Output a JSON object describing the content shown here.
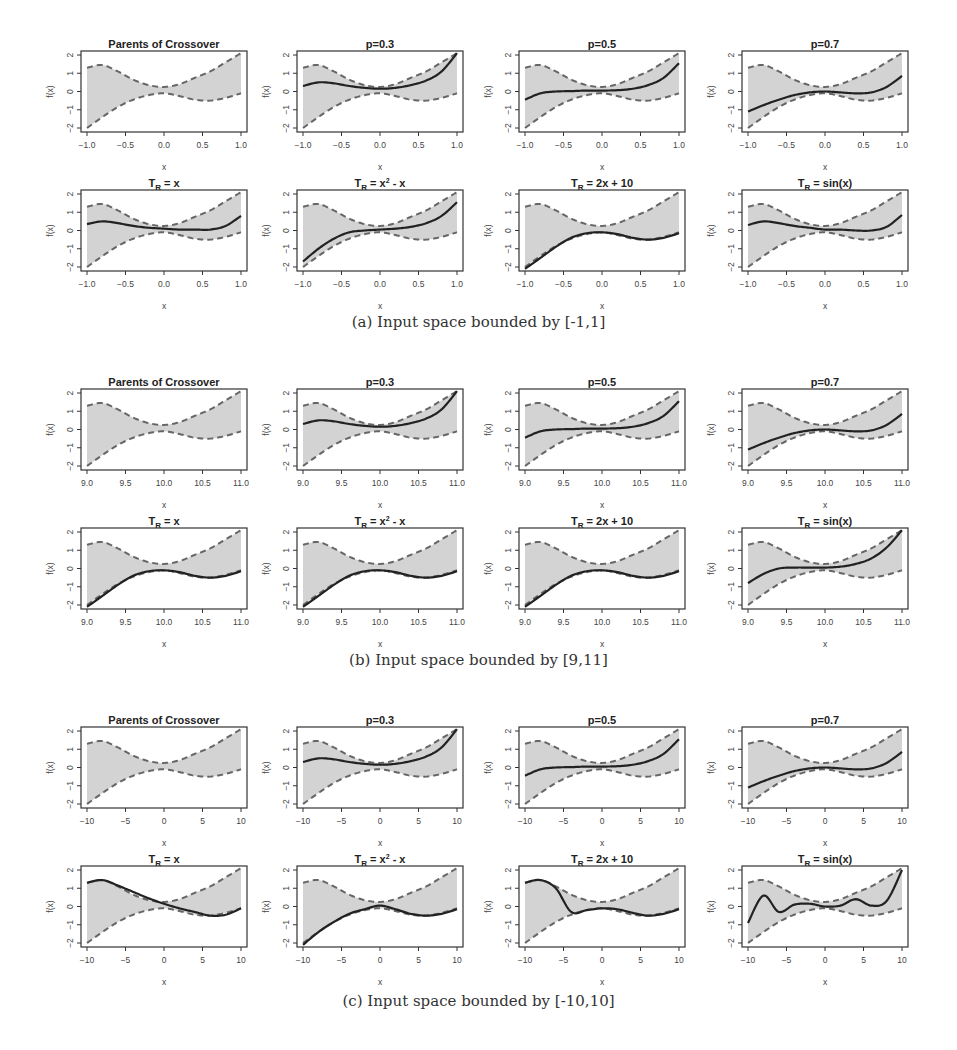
{
  "figure": {
    "subfigures": [
      {
        "id": "a",
        "caption": "(a) Input space bounded by [-1,1]",
        "xticks": [
          "-1.0",
          "-0.5",
          "0.0",
          "0.5",
          "1.0"
        ],
        "xrange": [
          -1,
          1
        ]
      },
      {
        "id": "b",
        "caption": "(b) Input space bounded by [9,11]",
        "xticks": [
          "9.0",
          "9.5",
          "10.0",
          "10.5",
          "11.0"
        ],
        "xrange": [
          9,
          11
        ]
      },
      {
        "id": "c",
        "caption": "(c) Input space bounded by [-10,10]",
        "xticks": [
          "-10",
          "-5",
          "0",
          "5",
          "10"
        ],
        "xrange": [
          -10,
          10
        ]
      }
    ],
    "plot_titles": [
      "Parents of Crossover",
      "p=0.3",
      "p=0.5",
      "p=0.7",
      "T_R = x",
      "T_R = x^2 - x",
      "T_R = 2x + 10",
      "T_R = sin(x)"
    ],
    "yticks": [
      "-2",
      "-1",
      "0",
      "1",
      "2"
    ],
    "xlabel": "x",
    "ylabel": "f(x)",
    "colors": {
      "band": "#d3d3d3",
      "dashed": "#666666",
      "curve": "#222222",
      "frame": "#333333"
    }
  },
  "chart_data": {
    "type": "line",
    "xlabel": "x (normalized position t in [0,1] across the input range)",
    "ylabel": "f(x)",
    "ylim": [
      -2,
      2
    ],
    "grid": false,
    "legend": "none",
    "t": [
      0,
      0.1,
      0.2,
      0.3,
      0.4,
      0.5,
      0.6,
      0.7,
      0.8,
      0.9,
      1.0
    ],
    "parent_upper": [
      1.3,
      1.45,
      1.1,
      0.65,
      0.35,
      0.25,
      0.4,
      0.75,
      1.1,
      1.6,
      2.1
    ],
    "parent_lower": [
      -2.0,
      -1.4,
      -0.85,
      -0.45,
      -0.2,
      -0.1,
      -0.25,
      -0.45,
      -0.5,
      -0.35,
      -0.1
    ],
    "panels": {
      "a": {
        "p=0.3": [
          0.3,
          0.5,
          0.45,
          0.3,
          0.2,
          0.15,
          0.2,
          0.35,
          0.6,
          1.1,
          2.1
        ],
        "p=0.5": [
          -0.45,
          -0.1,
          0.0,
          0.02,
          0.05,
          0.05,
          0.07,
          0.15,
          0.35,
          0.75,
          1.55
        ],
        "p=0.7": [
          -1.1,
          -0.75,
          -0.45,
          -0.2,
          -0.05,
          0.0,
          -0.05,
          -0.1,
          -0.05,
          0.25,
          0.85
        ],
        "T_R=x": [
          0.35,
          0.5,
          0.4,
          0.25,
          0.15,
          0.1,
          0.05,
          0.05,
          0.05,
          0.25,
          0.8
        ],
        "T_R=x^2-x": [
          -1.7,
          -1.0,
          -0.45,
          -0.1,
          0.0,
          0.05,
          0.1,
          0.2,
          0.4,
          0.8,
          1.55
        ],
        "T_R=2x+10": [
          -2.1,
          -1.5,
          -0.9,
          -0.4,
          -0.15,
          -0.1,
          -0.2,
          -0.4,
          -0.5,
          -0.4,
          -0.15
        ],
        "T_R=sin(x)": [
          0.3,
          0.5,
          0.4,
          0.25,
          0.15,
          0.05,
          0.05,
          0.0,
          0.0,
          0.2,
          0.85
        ]
      },
      "b": {
        "p=0.3": [
          0.3,
          0.5,
          0.45,
          0.3,
          0.2,
          0.15,
          0.2,
          0.35,
          0.6,
          1.1,
          2.1
        ],
        "p=0.5": [
          -0.45,
          -0.1,
          0.0,
          0.02,
          0.05,
          0.05,
          0.07,
          0.15,
          0.35,
          0.75,
          1.55
        ],
        "p=0.7": [
          -1.1,
          -0.75,
          -0.45,
          -0.2,
          -0.05,
          0.0,
          -0.05,
          -0.1,
          -0.05,
          0.25,
          0.85
        ],
        "T_R=x": [
          -2.1,
          -1.5,
          -0.9,
          -0.4,
          -0.15,
          -0.1,
          -0.2,
          -0.4,
          -0.5,
          -0.4,
          -0.15
        ],
        "T_R=x^2-x": [
          -2.1,
          -1.5,
          -0.9,
          -0.4,
          -0.15,
          -0.1,
          -0.2,
          -0.4,
          -0.5,
          -0.4,
          -0.15
        ],
        "T_R=2x+10": [
          -2.1,
          -1.5,
          -0.9,
          -0.4,
          -0.15,
          -0.1,
          -0.2,
          -0.4,
          -0.5,
          -0.4,
          -0.15
        ],
        "T_R=sin(x)": [
          -0.8,
          -0.3,
          0.0,
          0.05,
          0.05,
          0.05,
          0.1,
          0.25,
          0.55,
          1.15,
          2.1
        ]
      },
      "c": {
        "p=0.3": [
          0.3,
          0.5,
          0.45,
          0.3,
          0.2,
          0.15,
          0.2,
          0.35,
          0.6,
          1.1,
          2.1
        ],
        "p=0.5": [
          -0.45,
          -0.1,
          0.0,
          0.02,
          0.05,
          0.05,
          0.07,
          0.15,
          0.35,
          0.75,
          1.55
        ],
        "p=0.7": [
          -1.1,
          -0.75,
          -0.45,
          -0.2,
          -0.05,
          0.0,
          -0.05,
          -0.1,
          -0.05,
          0.25,
          0.85
        ],
        "T_R=x": [
          1.3,
          1.45,
          1.15,
          0.8,
          0.45,
          0.15,
          -0.1,
          -0.3,
          -0.5,
          -0.45,
          -0.1
        ],
        "T_R=x^2-x": [
          -2.1,
          -1.4,
          -0.85,
          -0.4,
          -0.15,
          0.05,
          -0.15,
          -0.4,
          -0.5,
          -0.4,
          -0.15
        ],
        "T_R=2x+10": [
          1.3,
          1.45,
          1.0,
          -0.3,
          -0.2,
          -0.1,
          -0.15,
          -0.35,
          -0.5,
          -0.4,
          -0.15
        ],
        "T_R=sin(x)": [
          -0.9,
          0.6,
          -0.3,
          0.1,
          0.15,
          0.0,
          0.05,
          0.4,
          0.05,
          0.3,
          2.0
        ]
      }
    }
  }
}
